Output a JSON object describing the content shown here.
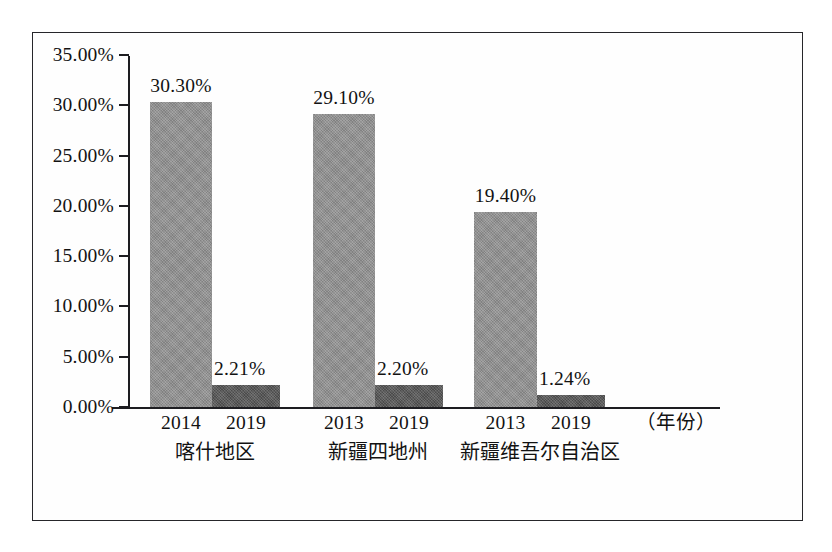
{
  "chart_data": {
    "type": "bar",
    "title": "",
    "xlabel": "（年份）",
    "ylabel": "",
    "ylim": [
      0,
      35
    ],
    "ytick_step": 5,
    "grid": false,
    "legend": "none",
    "y_ticks": [
      "0.00%",
      "5.00%",
      "10.00%",
      "15.00%",
      "20.00%",
      "25.00%",
      "30.00%",
      "35.00%"
    ],
    "y_tick_values": [
      0,
      5,
      10,
      15,
      20,
      25,
      30,
      35
    ],
    "categories": [
      "喀什地区",
      "新疆四地州",
      "新疆维吾尔自治区"
    ],
    "groups": [
      {
        "name": "喀什地区",
        "bars": [
          {
            "year": "2014",
            "value": 30.3,
            "label": "30.30%",
            "series": "base-year"
          },
          {
            "year": "2019",
            "value": 2.21,
            "label": "2.21%",
            "series": "2019"
          }
        ]
      },
      {
        "name": "新疆四地州",
        "bars": [
          {
            "year": "2013",
            "value": 29.1,
            "label": "29.10%",
            "series": "base-year"
          },
          {
            "year": "2019",
            "value": 2.2,
            "label": "2.20%",
            "series": "2019"
          }
        ]
      },
      {
        "name": "新疆维吾尔自治区",
        "bars": [
          {
            "year": "2013",
            "value": 19.4,
            "label": "19.40%",
            "series": "base-year"
          },
          {
            "year": "2019",
            "value": 1.24,
            "label": "1.24%",
            "series": "2019"
          }
        ]
      }
    ],
    "series": [
      {
        "name": "base-year",
        "color": "#8e8e8e",
        "values": [
          30.3,
          29.1,
          19.4
        ]
      },
      {
        "name": "2019",
        "color": "#545454",
        "values": [
          2.21,
          2.2,
          1.24
        ]
      }
    ],
    "colors": {
      "bar_light": "#8e8e8e",
      "bar_dark": "#545454",
      "axis": "#1d1d21",
      "frame": "#26262a",
      "background": "#ffffff",
      "text": "#121212"
    }
  }
}
